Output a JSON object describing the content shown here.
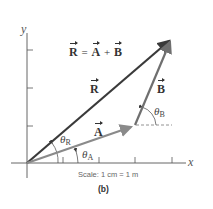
{
  "diagram": {
    "equation": {
      "lhs": "R",
      "eq": "=",
      "a": "A",
      "plus": "+",
      "b": "B"
    },
    "vectors": {
      "A": {
        "label": "A",
        "color": "#8a8a8a"
      },
      "B": {
        "label": "B",
        "color": "#6f6f6f"
      },
      "R": {
        "label": "R",
        "color": "#3a3a3a"
      }
    },
    "angles": {
      "theta_R": {
        "symbol": "θ",
        "sub": "R"
      },
      "theta_A": {
        "symbol": "θ",
        "sub": "A"
      },
      "theta_B": {
        "symbol": "θ",
        "sub": "B"
      }
    },
    "axes": {
      "x_label": "x",
      "y_label": "y"
    },
    "scale_text": "Scale: 1 cm = 1 m",
    "caption": "(b)"
  }
}
